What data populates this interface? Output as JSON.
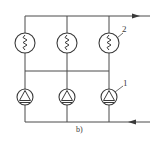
{
  "diagram": {
    "caption": "b)",
    "labels": {
      "heater_label": "2",
      "pump_label": "1"
    },
    "columns": [
      {
        "id": "col-1",
        "heater": "resistor-heater-icon",
        "pump": "pump-icon"
      },
      {
        "id": "col-2",
        "heater": "resistor-heater-icon",
        "pump": "pump-icon"
      },
      {
        "id": "col-3",
        "heater": "resistor-heater-icon",
        "pump": "pump-icon"
      }
    ],
    "flow": {
      "top_line_direction": "right",
      "bottom_line_direction": "left"
    },
    "colors": {
      "line": "#4a4a4a",
      "background": "#ffffff"
    }
  }
}
